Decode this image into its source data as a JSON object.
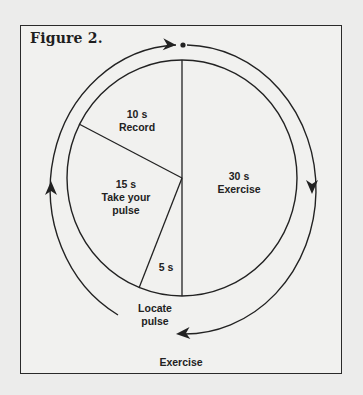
{
  "figure": {
    "title": "Figure 2.",
    "bottom_label": "Exercise",
    "outer_cycle_label": "Locate pulse",
    "segments": [
      {
        "id": "exercise",
        "duration": "30 s",
        "activity": "Exercise"
      },
      {
        "id": "locate",
        "duration": "5 s",
        "activity": "Locate pulse"
      },
      {
        "id": "take-pulse",
        "duration": "15 s",
        "activity": "Take your pulse"
      },
      {
        "id": "record",
        "duration": "10 s",
        "activity": "Record"
      }
    ],
    "labels": {
      "record_time": "10 s",
      "record_text": "Record",
      "exercise_time": "30 s",
      "exercise_text": "Exercise",
      "pulse_time": "15 s",
      "pulse_text_1": "Take your",
      "pulse_text_2": "pulse",
      "locate_time": "5 s",
      "locate_text_1": "Locate",
      "locate_text_2": "pulse",
      "bottom_exercise": "Exercise"
    },
    "colors": {
      "ink": "#222222",
      "paper": "#f1f1ef",
      "background": "#ececeb"
    }
  }
}
